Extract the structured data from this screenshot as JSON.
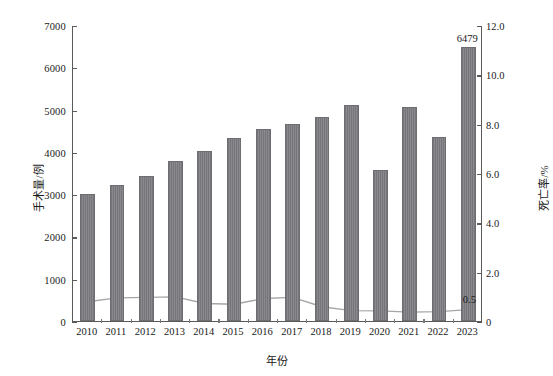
{
  "chart_data": {
    "type": "bar",
    "title": "",
    "xlabel": "年份",
    "ylabel": "手术量/例",
    "ylabel_right": "死亡率/%",
    "categories": [
      "2010",
      "2011",
      "2012",
      "2013",
      "2014",
      "2015",
      "2016",
      "2017",
      "2018",
      "2019",
      "2020",
      "2021",
      "2022",
      "2023"
    ],
    "ylim": [
      0,
      7000
    ],
    "ylim_right": [
      0,
      12.0
    ],
    "yticks": [
      "0",
      "1000",
      "2000",
      "3000",
      "4000",
      "5000",
      "6000",
      "7000"
    ],
    "ytick_values": [
      0,
      1000,
      2000,
      3000,
      4000,
      5000,
      6000,
      7000
    ],
    "yticks_right": [
      "0",
      "2.0",
      "4.0",
      "6.0",
      "8.0",
      "10.0",
      "12.0"
    ],
    "ytick_values_right": [
      0,
      2.0,
      4.0,
      6.0,
      8.0,
      10.0,
      12.0
    ],
    "grid": false,
    "legend": null,
    "series": [
      {
        "name": "手术量/例",
        "type": "bar",
        "axis": "left",
        "color": "#7f7f83",
        "values": [
          3000,
          3210,
          3430,
          3790,
          4030,
          4330,
          4540,
          4670,
          4830,
          5120,
          3560,
          5060,
          4360,
          6479
        ],
        "labels": [
          "",
          "",
          "",
          "",
          "",
          "",
          "",
          "",
          "",
          "",
          "",
          "",
          "",
          "6479"
        ]
      },
      {
        "name": "死亡率/%",
        "type": "line",
        "axis": "right",
        "color": "#a6a6a6",
        "marker": "diamond",
        "values": [
          0.82,
          0.98,
          1.0,
          1.02,
          0.75,
          0.72,
          0.95,
          1.0,
          0.62,
          0.46,
          0.45,
          0.4,
          0.42,
          0.5
        ],
        "labels": [
          "",
          "",
          "",
          "",
          "",
          "",
          "",
          "",
          "",
          "",
          "",
          "",
          "",
          "0.5"
        ]
      }
    ]
  },
  "axis": {
    "left_title": "手术量/例",
    "right_title": "死亡率/%",
    "bottom_title": "年份"
  }
}
